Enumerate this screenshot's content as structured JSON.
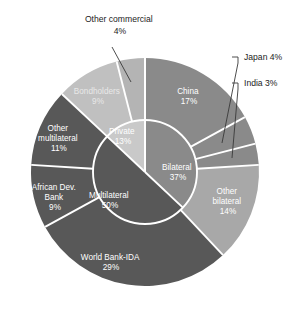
{
  "chart_data": {
    "type": "pie",
    "title": "",
    "subtitle": "",
    "xlabel": "",
    "ylabel": "",
    "legend_position": "none",
    "grid": false,
    "variant": "nested-donut-two-ring",
    "units": "percent",
    "rings": [
      {
        "name": "inner",
        "level": "creditor-group",
        "categories": [
          "Bilateral",
          "Multilateral",
          "Private"
        ],
        "values": [
          37,
          50,
          13
        ],
        "labels": [
          "Bilateral\n37%",
          "Multilateral\n50%",
          "Private\n13%"
        ],
        "colors": [
          "#8a8a8a",
          "#585858",
          "#c9c9c9"
        ]
      },
      {
        "name": "outer",
        "level": "creditor",
        "categories": [
          "China",
          "Japan",
          "India",
          "Other bilateral",
          "World Bank-IDA",
          "African Dev. Bank",
          "Other multilateral",
          "Bondholders",
          "Other commercial"
        ],
        "values": [
          17,
          4,
          3,
          14,
          29,
          9,
          11,
          9,
          4
        ],
        "parents": [
          "Bilateral",
          "Bilateral",
          "Bilateral",
          "Bilateral",
          "Multilateral",
          "Multilateral",
          "Multilateral",
          "Private",
          "Private"
        ],
        "colors": [
          "#8a8a8a",
          "#8a8a8a",
          "#8a8a8a",
          "#a8a8a8",
          "#585858",
          "#585858",
          "#585858",
          "#c0c0c0",
          "#b4b4b4"
        ]
      }
    ],
    "inner_labels": [
      {
        "name": "Bilateral",
        "value": 37,
        "line1": "Bilateral",
        "line2": "37%",
        "text_color": "#ffffff"
      },
      {
        "name": "Multilateral",
        "value": 50,
        "line1": "Multilateral",
        "line2": "50%",
        "text_color": "#ffffff"
      },
      {
        "name": "Private",
        "value": 13,
        "line1": "Private",
        "line2": "13%",
        "text_color": "#ffffff"
      }
    ],
    "outer_labels": [
      {
        "name": "China",
        "value": 17,
        "line1": "China",
        "line2": "17%",
        "text_color": "#ffffff"
      },
      {
        "name": "Other bilateral",
        "value": 14,
        "line1": "Other",
        "line2": "bilateral",
        "line3": "14%",
        "text_color": "#ffffff"
      },
      {
        "name": "World Bank-IDA",
        "value": 29,
        "line1": "World Bank-IDA",
        "line2": "29%",
        "text_color": "#ffffff"
      },
      {
        "name": "African Dev. Bank",
        "value": 9,
        "line1": "African Dev.",
        "line2": "Bank",
        "line3": "9%",
        "text_color": "#ffffff"
      },
      {
        "name": "Other multilateral",
        "value": 11,
        "line1": "Other",
        "line2": "multilateral",
        "line3": "11%",
        "text_color": "#ffffff"
      },
      {
        "name": "Bondholders",
        "value": 9,
        "line1": "Bondholders",
        "line2": "9%",
        "text_color": "#e8e8e8"
      }
    ],
    "callouts": [
      {
        "name": "Other commercial",
        "value": 4,
        "line1": "Other commercial",
        "line2": "4%",
        "text_color": "#1c1c1c"
      },
      {
        "name": "Japan",
        "value": 4,
        "line1": "Japan 4%",
        "text_color": "#1c1c1c"
      },
      {
        "name": "India",
        "value": 3,
        "line1": "India 3%",
        "text_color": "#1c1c1c"
      }
    ],
    "colors": {
      "bilateral": "#8a8a8a",
      "bilateral_other": "#a8a8a8",
      "multilateral": "#585858",
      "private": "#c9c9c9",
      "private_bondholders": "#c0c0c0",
      "private_other_commercial": "#b4b4b4",
      "separator": "#ffffff",
      "leader_line": "#3a3a3a",
      "background": "#ffffff"
    },
    "geometry": {
      "center_x": 145,
      "center_y": 172,
      "outer_radius": 114,
      "inner_radius": 52,
      "start_angle_deg": 0,
      "direction": "clockwise"
    }
  }
}
